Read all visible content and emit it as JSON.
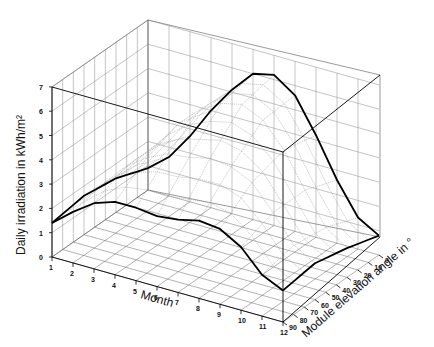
{
  "chart_data": {
    "type": "surface3d",
    "title": "",
    "xlabel": "Month",
    "ylabel": "Module elevation angle in °",
    "zlabel": "Daily irradiation in kWh/m²",
    "x": [
      1,
      2,
      3,
      4,
      5,
      6,
      7,
      8,
      9,
      10,
      11,
      12
    ],
    "y": [
      0,
      10,
      20,
      30,
      40,
      50,
      60,
      70,
      80,
      90
    ],
    "zlim": [
      0,
      7
    ],
    "z_ticks": [
      "0",
      "1",
      "2",
      "3",
      "4",
      "5",
      "6",
      "7"
    ],
    "x_ticks": [
      "1",
      "2",
      "3",
      "4",
      "5",
      "6",
      "7",
      "8",
      "9",
      "10",
      "11",
      "12"
    ],
    "y_ticks": [
      "0",
      "10",
      "20",
      "30",
      "40",
      "50",
      "60",
      "70",
      "80",
      "90"
    ],
    "grid": true,
    "series": [
      {
        "name": "elevation 0°",
        "values": [
          0.9,
          1.6,
          2.7,
          4.0,
          5.1,
          6.0,
          6.2,
          5.6,
          4.2,
          2.6,
          1.3,
          0.8
        ]
      },
      {
        "name": "elevation 30°",
        "values": [
          1.4,
          2.2,
          3.3,
          4.4,
          5.2,
          5.7,
          5.9,
          5.5,
          4.5,
          3.1,
          1.8,
          1.2
        ]
      },
      {
        "name": "elevation 60°",
        "values": [
          1.6,
          2.4,
          3.3,
          3.9,
          4.3,
          4.4,
          4.6,
          4.5,
          4.1,
          3.1,
          2.0,
          1.5
        ]
      },
      {
        "name": "elevation 90°",
        "values": [
          1.4,
          2.1,
          2.7,
          3.0,
          3.0,
          2.9,
          3.0,
          3.2,
          3.1,
          2.6,
          1.7,
          1.3
        ]
      }
    ]
  },
  "labels": {
    "z_axis": "Daily irradiation in kWh/m²",
    "x_axis": "Month",
    "y_axis": "Module elevation angle in °"
  }
}
